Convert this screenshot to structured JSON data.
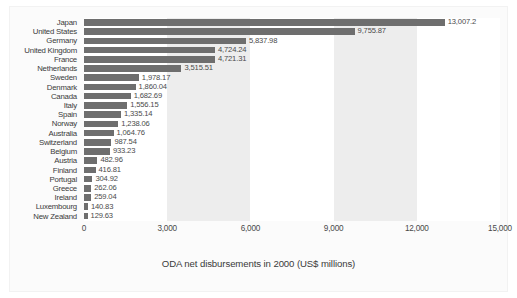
{
  "chart_data": {
    "type": "bar",
    "orientation": "horizontal",
    "title": "",
    "xlabel": "ODA net disbursements in 2000 (US$ millions)",
    "ylabel": "",
    "xlim": [
      0,
      15000
    ],
    "xticks": [
      "0",
      "3,000",
      "6,000",
      "9,000",
      "12,000",
      "15,000"
    ],
    "xtick_values": [
      0,
      3000,
      6000,
      9000,
      12000,
      15000
    ],
    "grid": false,
    "alternating_bands": true,
    "legend": null,
    "bar_color": "#6e6e6e",
    "band_color": "#ededed",
    "categories": [
      "Japan",
      "United States",
      "Germany",
      "United Kingdom",
      "France",
      "Netherlands",
      "Sweden",
      "Denmark",
      "Canada",
      "Italy",
      "Spain",
      "Norway",
      "Australia",
      "Switzerland",
      "Belgium",
      "Austria",
      "Finland",
      "Portugal",
      "Greece",
      "Ireland",
      "Luxembourg",
      "New Zealand"
    ],
    "values": [
      13007.2,
      9755.87,
      5837.98,
      4724.24,
      4721.31,
      3515.51,
      1978.17,
      1860.04,
      1682.69,
      1556.15,
      1335.14,
      1238.06,
      1064.76,
      987.54,
      933.23,
      482.96,
      416.81,
      304.92,
      262.06,
      259.04,
      140.83,
      129.63
    ],
    "value_labels": [
      "13,007.2",
      "9,755.87",
      "5,837.98",
      "4,724.24",
      "4,721.31",
      "3,515.51",
      "1,978.17",
      "1,860.04",
      "1,682.69",
      "1,556.15",
      "1,335.14",
      "1,238.06",
      "1,064.76",
      "987.54",
      "933.23",
      "482.96",
      "416.81",
      "304.92",
      "262.06",
      "259.04",
      "140.83",
      "129.63"
    ]
  }
}
